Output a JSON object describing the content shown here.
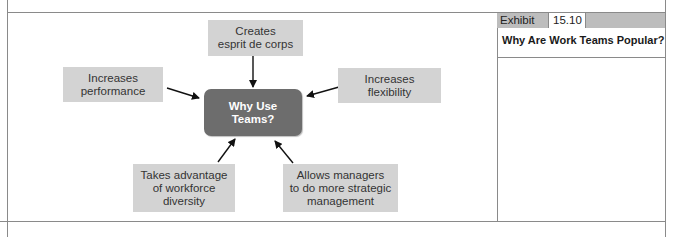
{
  "exhibit": {
    "label": "Exhibit",
    "number": "15.10",
    "title": "Why Are Work Teams Popular?"
  },
  "diagram": {
    "center": {
      "line1": "Why Use",
      "line2": "Teams?"
    },
    "nodes": [
      {
        "id": "esprit",
        "lines": [
          "Creates",
          "esprit de corps"
        ]
      },
      {
        "id": "performance",
        "lines": [
          "Increases",
          "performance"
        ]
      },
      {
        "id": "flexibility",
        "lines": [
          "Increases",
          "flexibility"
        ]
      },
      {
        "id": "diversity",
        "lines": [
          "Takes advantage",
          "of workforce",
          "diversity"
        ]
      },
      {
        "id": "strategic",
        "lines": [
          "Allows managers",
          "to do more strategic",
          "management"
        ]
      }
    ]
  },
  "colors": {
    "node_fill": "#d3d3d3",
    "center_fill": "#6d6d6d",
    "rule": "#8a8a8a",
    "exhibit_header": "#bdbdbd"
  }
}
